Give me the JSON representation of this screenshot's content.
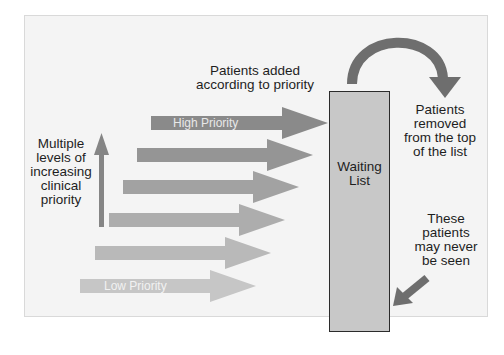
{
  "diagram": {
    "title_label": "Patients added according to priority",
    "title_lines": [
      "Patients added",
      "according to priority"
    ],
    "left_label_lines": [
      "Multiple",
      "levels of",
      "increasing",
      "clinical",
      "priority"
    ],
    "removed_label_lines": [
      "Patients",
      "removed",
      "from the top",
      "of the list"
    ],
    "never_seen_label_lines": [
      "These",
      "patients",
      "may never",
      "be seen"
    ],
    "waiting_list_lines": [
      "Waiting",
      "List"
    ],
    "priority_arrows": [
      {
        "label": "High Priority",
        "level": 6,
        "color": "#8a8a8a"
      },
      {
        "label": "",
        "level": 5,
        "color": "#959595"
      },
      {
        "label": "",
        "level": 4,
        "color": "#a2a2a2"
      },
      {
        "label": "",
        "level": 3,
        "color": "#adadad"
      },
      {
        "label": "",
        "level": 2,
        "color": "#b9b9b9"
      },
      {
        "label": "Low Priority",
        "level": 1,
        "color": "#c6c6c6"
      }
    ],
    "colors": {
      "background": "#f4f4f4",
      "panel_border": "#d8d8d8",
      "waiting_list_fill": "#c8c8c8",
      "waiting_list_border": "#2b2b2b",
      "curved_arrow": "#6e6e6e",
      "diagonal_arrow": "#6e6e6e",
      "vertical_arrow": "#858585",
      "text": "#1e1e1e",
      "arrow_text": "#ececec"
    }
  }
}
